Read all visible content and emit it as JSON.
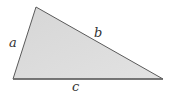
{
  "diagram": {
    "type": "triangle",
    "labels": {
      "a": "a",
      "b": "b",
      "c": "c"
    },
    "colors": {
      "fill": "#d9d9d9",
      "stroke": "#555555",
      "label": "#333333"
    }
  }
}
